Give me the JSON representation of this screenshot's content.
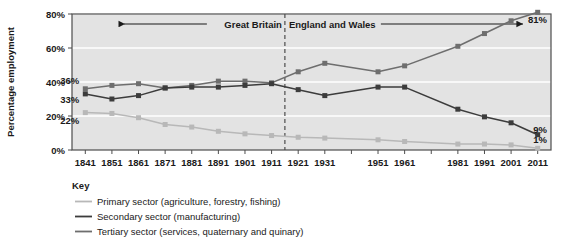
{
  "chart_data": {
    "type": "line",
    "title": "",
    "xlabel": "",
    "ylabel": "Percentage employment",
    "ylim": [
      0,
      80
    ],
    "yticks": [
      0,
      20,
      40,
      60,
      80
    ],
    "ytick_labels": [
      "0%",
      "20%",
      "40%",
      "60%",
      "80%"
    ],
    "grid": "horizontal-white",
    "legend_position": "below-left",
    "categories": [
      "1841",
      "1851",
      "1861",
      "1871",
      "1881",
      "1891",
      "1901",
      "1911",
      "1921",
      "1931",
      "1941",
      "1951",
      "1961",
      "1971",
      "1981",
      "1991",
      "2001",
      "2011"
    ],
    "xtick_labels": [
      "1841",
      "1851",
      "1861",
      "1871",
      "1881",
      "1891",
      "1901",
      "1911",
      "1921",
      "1931",
      "",
      "1951",
      "1961",
      "",
      "1981",
      "1991",
      "2001",
      "2011"
    ],
    "series": [
      {
        "name": "Primary sector (agriculture, forestry, fishing)",
        "color": "#b8b8b8",
        "values": [
          22,
          21.5,
          19,
          15,
          13.5,
          11,
          9.5,
          8.5,
          7.5,
          7,
          null,
          6,
          5,
          null,
          3.5,
          3.5,
          3,
          1
        ]
      },
      {
        "name": "Secondary sector (manufacturing)",
        "color": "#3c3c3c",
        "values": [
          33,
          30,
          32,
          36.5,
          37,
          37,
          38,
          39,
          35.5,
          32,
          null,
          37,
          37,
          null,
          24,
          19.5,
          16,
          9
        ]
      },
      {
        "name": "Tertiary sector (services, quaternary and quinary)",
        "color": "#6e6e6e",
        "values": [
          36,
          38,
          39,
          36.5,
          38,
          40.5,
          40.5,
          39.5,
          46,
          51,
          null,
          46,
          49.5,
          null,
          61,
          68.5,
          76,
          81
        ]
      }
    ],
    "point_labels": [
      {
        "text": "36%",
        "series": "Tertiary sector (services, quaternary and quinary)",
        "category": "1841",
        "value": 36
      },
      {
        "text": "33%",
        "series": "Secondary sector (manufacturing)",
        "category": "1841",
        "value": 33
      },
      {
        "text": "22%",
        "series": "Primary sector (agriculture, forestry, fishing)",
        "category": "1841",
        "value": 22
      },
      {
        "text": "81%",
        "series": "Tertiary sector (services, quaternary and quinary)",
        "category": "2011",
        "value": 81
      },
      {
        "text": "9%",
        "series": "Secondary sector (manufacturing)",
        "category": "2011",
        "value": 9
      },
      {
        "text": "1%",
        "series": "Primary sector (agriculture, forestry, fishing)",
        "category": "2011",
        "value": 1
      }
    ],
    "annotations": [
      {
        "name": "region-left",
        "text": "Great Britain",
        "arrow": "left"
      },
      {
        "name": "region-right",
        "text": "England and Wales",
        "arrow": "right"
      },
      {
        "name": "divider",
        "text": "",
        "at_category": "1916",
        "style": "dashed-vertical"
      }
    ],
    "colors": {
      "plot_background": "#e3e3e3",
      "gridline": "#ffffff",
      "axis": "#4d4d4d",
      "text": "#1a1a1a",
      "primary": "#b8b8b8",
      "secondary": "#3c3c3c",
      "tertiary": "#6e6e6e"
    }
  },
  "key": {
    "title": "Key",
    "items": [
      {
        "label": "Primary sector (agriculture, forestry, fishing)",
        "color": "#b8b8b8"
      },
      {
        "label": "Secondary sector (manufacturing)",
        "color": "#3c3c3c"
      },
      {
        "label": "Tertiary sector (services, quaternary and quinary)",
        "color": "#6e6e6e"
      }
    ]
  },
  "axes": {
    "y_title": "Percentage employment"
  }
}
